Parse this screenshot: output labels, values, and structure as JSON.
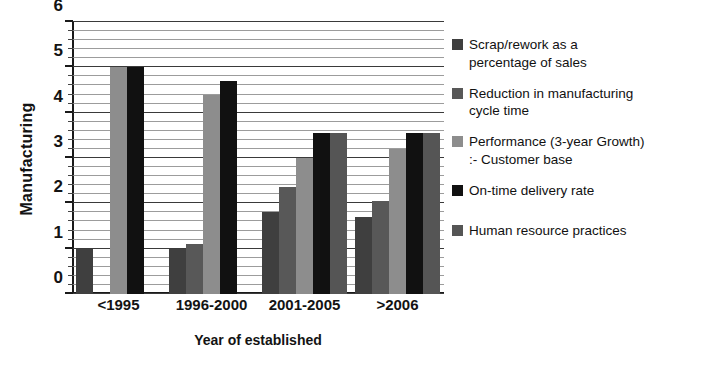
{
  "chart_data": {
    "type": "bar",
    "title": "",
    "xlabel": "Year of established",
    "ylabel": "Manufacturing",
    "categories": [
      "<1995",
      "1996-2000",
      "2001-2005",
      ">2006"
    ],
    "ylim": [
      0,
      6
    ],
    "yticks": [
      0,
      1,
      2,
      3,
      4,
      5,
      6
    ],
    "ytick_labels": [
      "0",
      "1",
      "2",
      "3",
      "4",
      "5",
      "6"
    ],
    "minor_tick_step": 0.2,
    "grid": true,
    "legend_position": "right",
    "series": [
      {
        "name": "Scrap/rework as a percentage of sales",
        "color": "#3f3f3f",
        "values": [
          1.0,
          1.0,
          1.8,
          1.7
        ]
      },
      {
        "name": "Reduction in manufacturing cycle time",
        "color": "#585858",
        "values": [
          0,
          1.1,
          2.35,
          2.05
        ]
      },
      {
        "name": "Performance (3-year Growth) :- Customer base",
        "color": "#8d8d8d",
        "values": [
          5.0,
          4.4,
          3.0,
          3.2
        ]
      },
      {
        "name": "On-time delivery rate",
        "color": "#111111",
        "values": [
          5.0,
          4.7,
          3.55,
          3.55
        ]
      },
      {
        "name": "Human resource practices",
        "color": "#555555",
        "values": [
          0,
          0,
          3.55,
          3.55
        ]
      }
    ]
  },
  "legend": {
    "items": [
      {
        "label_line1": "Scrap/rework as a",
        "label_line2": "percentage of sales",
        "swatch": "#3f3f3f"
      },
      {
        "label_line1": "Reduction in manufacturing",
        "label_line2": "cycle time",
        "swatch": "#585858"
      },
      {
        "label_line1": "Performance (3-year Growth)",
        "label_line2": ":- Customer base",
        "swatch": "#8d8d8d"
      },
      {
        "label_line1": "On-time delivery rate",
        "label_line2": "",
        "swatch": "#111111"
      },
      {
        "label_line1": "Human resource practices",
        "label_line2": "",
        "swatch": "#555555"
      }
    ]
  },
  "axes": {
    "y_title": "Manufacturing",
    "x_title": "Year of established"
  }
}
